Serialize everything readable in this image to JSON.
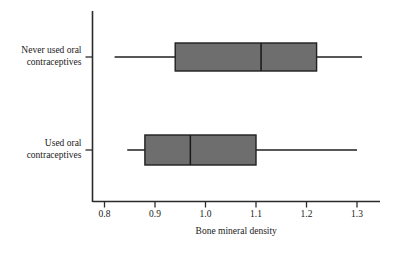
{
  "figure": {
    "background_color": "#ffffff",
    "axis_color": "#2b2b2b",
    "box_fill_color": "#6e6e6e",
    "box_edge_color": "#1f1f1f"
  },
  "axes": {
    "x_axis_title": "Bone mineral density",
    "x_tick_labels": [
      "0.8",
      "0.9",
      "1.0",
      "1.1",
      "1.2",
      "1.3"
    ],
    "x_tick_values": [
      0.8,
      0.9,
      1.0,
      1.1,
      1.2,
      1.3
    ],
    "category_labels": [
      {
        "line1": "Never used oral",
        "line2": "contraceptives"
      },
      {
        "line1": "Used oral",
        "line2": "contraceptives"
      }
    ]
  },
  "chart_data": {
    "type": "box",
    "orientation": "horizontal",
    "title": "",
    "xlabel": "Bone mineral density",
    "ylabel": "",
    "xlim": [
      0.8,
      1.3
    ],
    "grid": false,
    "legend": "none",
    "categories": [
      "Never used oral contraceptives",
      "Used oral contraceptives"
    ],
    "boxes": [
      {
        "category": "Never used oral contraceptives",
        "whisker_low": 0.82,
        "q1": 0.94,
        "median": 1.11,
        "q3": 1.22,
        "whisker_high": 1.31
      },
      {
        "category": "Used oral contraceptives",
        "whisker_low": 0.845,
        "q1": 0.88,
        "median": 0.97,
        "q3": 1.1,
        "whisker_high": 1.3
      }
    ]
  }
}
